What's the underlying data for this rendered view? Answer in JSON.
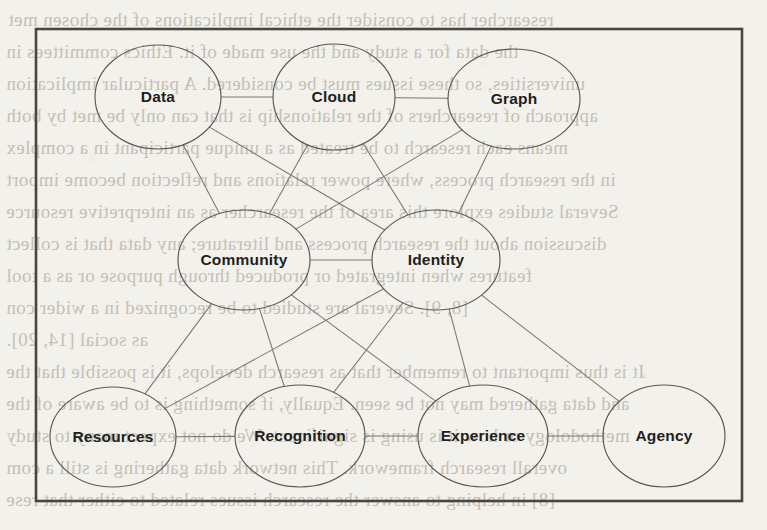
{
  "page": {
    "kind": "scanned-book-figure",
    "background_color": "#f3f1ec",
    "frame_color": "#4a453f",
    "node_stroke_color": "#5c574f",
    "edge_color": "#7b766d",
    "label_color": "#221f1d"
  },
  "diagram": {
    "type": "node-link-graph",
    "frame": {
      "x": 36,
      "y": 29,
      "width": 706,
      "height": 472
    },
    "nodes": [
      {
        "id": "data",
        "label": "Data",
        "cx": 158,
        "cy": 97,
        "rx": 63,
        "ry": 52,
        "row": "top"
      },
      {
        "id": "cloud",
        "label": "Cloud",
        "cx": 334,
        "cy": 97,
        "rx": 61,
        "ry": 53,
        "row": "top"
      },
      {
        "id": "graph",
        "label": "Graph",
        "cx": 514,
        "cy": 99,
        "rx": 66,
        "ry": 50,
        "row": "top"
      },
      {
        "id": "community",
        "label": "Community",
        "cx": 244,
        "cy": 260,
        "rx": 66,
        "ry": 50,
        "row": "middle"
      },
      {
        "id": "identity",
        "label": "Identity",
        "cx": 436,
        "cy": 260,
        "rx": 64,
        "ry": 50,
        "row": "middle"
      },
      {
        "id": "resources",
        "label": "Resources",
        "cx": 113,
        "cy": 437,
        "rx": 63,
        "ry": 50,
        "row": "bottom"
      },
      {
        "id": "recognition",
        "label": "Recognition",
        "cx": 300,
        "cy": 436,
        "rx": 65,
        "ry": 51,
        "row": "bottom"
      },
      {
        "id": "experience",
        "label": "Experience",
        "cx": 483,
        "cy": 436,
        "rx": 65,
        "ry": 51,
        "row": "bottom"
      },
      {
        "id": "agency",
        "label": "Agency",
        "cx": 664,
        "cy": 436,
        "rx": 61,
        "ry": 51,
        "row": "bottom"
      }
    ],
    "edges": [
      {
        "from": "data",
        "to": "cloud"
      },
      {
        "from": "cloud",
        "to": "graph"
      },
      {
        "from": "data",
        "to": "community"
      },
      {
        "from": "data",
        "to": "identity"
      },
      {
        "from": "cloud",
        "to": "community"
      },
      {
        "from": "cloud",
        "to": "identity"
      },
      {
        "from": "graph",
        "to": "community"
      },
      {
        "from": "graph",
        "to": "identity"
      },
      {
        "from": "community",
        "to": "identity"
      },
      {
        "from": "community",
        "to": "resources"
      },
      {
        "from": "community",
        "to": "recognition"
      },
      {
        "from": "community",
        "to": "experience"
      },
      {
        "from": "identity",
        "to": "resources"
      },
      {
        "from": "identity",
        "to": "recognition"
      },
      {
        "from": "identity",
        "to": "experience"
      },
      {
        "from": "identity",
        "to": "agency"
      },
      {
        "from": "resources",
        "to": "recognition"
      },
      {
        "from": "recognition",
        "to": "experience"
      },
      {
        "from": "experience",
        "to": "agency"
      }
    ]
  },
  "bleed_through_text": {
    "description": "Faint mirrored text showing through from the reverse side of the page",
    "lines": [
      {
        "text": "researcher has to consider the ethical implications of the chosen met",
        "x": 8,
        "y": 4
      },
      {
        "text": "the data for a study and the use made of it. Ethics committees in",
        "x": 6,
        "y": 36
      },
      {
        "text": "universities, so these issues must be considered. A particular implication",
        "x": 6,
        "y": 68
      },
      {
        "text": "approach of researchers of the relationship is that can only be met by both",
        "x": 6,
        "y": 100
      },
      {
        "text": "means each research to be treated as a unique participant in a complex",
        "x": 6,
        "y": 132
      },
      {
        "text": "in the research process, where power relations and reflection become import",
        "x": 6,
        "y": 164
      },
      {
        "text": "Several studies explore this area of the researcher as an interpretive resource",
        "x": 6,
        "y": 196
      },
      {
        "text": "discussion about the research process and literature; any data that is collect",
        "x": 6,
        "y": 228
      },
      {
        "text": "features when integrated or produced through purpose or as a tool",
        "x": 6,
        "y": 260
      },
      {
        "text": "[8, 9]. Several are studied to be recognized in a wider con",
        "x": 6,
        "y": 292
      },
      {
        "text": "as social [14, 20].",
        "x": 6,
        "y": 324
      },
      {
        "text": "It is thus important to remember that as research develops, it is possible that the",
        "x": 6,
        "y": 356
      },
      {
        "text": "and data gathered may not be seen. Equally, if something is to be aware of the",
        "x": 6,
        "y": 388
      },
      {
        "text": "methodology or how it is using is significant. We do not expect many to study",
        "x": 6,
        "y": 420
      },
      {
        "text": "overall research framework. This network data gathering is still a com",
        "x": 6,
        "y": 452
      },
      {
        "text": "[8] in helping to answer the research issues related to either that rese",
        "x": 6,
        "y": 484
      }
    ]
  }
}
